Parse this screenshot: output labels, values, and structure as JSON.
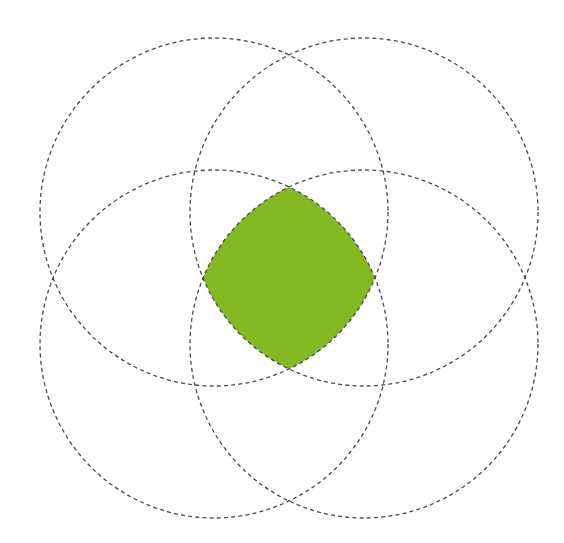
{
  "diagram": {
    "type": "four-circle-overlap",
    "canvas": {
      "width": 564,
      "height": 543,
      "background": "#ffffff"
    },
    "radius": 174,
    "circles": [
      {
        "id": "top-left",
        "cx": 214,
        "cy": 212
      },
      {
        "id": "top-right",
        "cx": 364,
        "cy": 212
      },
      {
        "id": "bottom-left",
        "cx": 214,
        "cy": 344
      },
      {
        "id": "bottom-right",
        "cx": 364,
        "cy": 344
      }
    ],
    "stroke": {
      "color": "#4a4a4a",
      "width": 1.3,
      "dash": "4 3.2"
    },
    "intersection": {
      "fill": "#84b924",
      "label": "intersection of all four circles"
    }
  }
}
